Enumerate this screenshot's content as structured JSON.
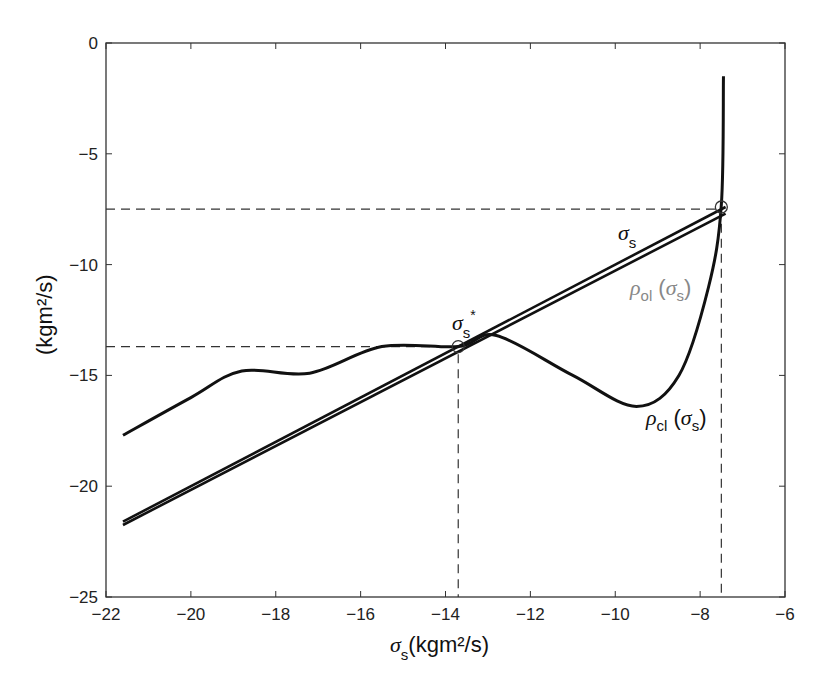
{
  "chart_data": {
    "type": "line",
    "title": "",
    "xlabel": "σs⁻ (kgm²/s)",
    "ylabel": "(kgm²/s)",
    "xlim": [
      -22,
      -6
    ],
    "ylim": [
      -25,
      0
    ],
    "xticks": [
      "-22",
      "-20",
      "-18",
      "-16",
      "-14",
      "-12",
      "-10",
      "-8",
      "-6"
    ],
    "yticks": [
      "0",
      "-5",
      "-10",
      "-15",
      "-20",
      "-25"
    ],
    "grid": false,
    "series": [
      {
        "name": "σs⁻ (identity line)",
        "x": [
          -21.6,
          -7.4
        ],
        "y": [
          -21.6,
          -7.4
        ]
      },
      {
        "name": "ρol(σs⁻)",
        "x": [
          -21.6,
          -7.4
        ],
        "y": [
          -21.75,
          -7.7
        ]
      },
      {
        "name": "ρcl(σs⁻)",
        "x": [
          -21.6,
          -20,
          -18.8,
          -17.2,
          -15.5,
          -13.7,
          -12.8,
          -11,
          -9.5,
          -8.5,
          -7.8,
          -7.5,
          -7.45
        ],
        "y": [
          -17.7,
          -16,
          -14.8,
          -14.9,
          -13.7,
          -13.7,
          -13.2,
          -15,
          -16.4,
          -15,
          -11,
          -7.3,
          -1.5
        ]
      }
    ],
    "annotations": [
      {
        "text": "σs⁻*",
        "x": -13.7,
        "y": -13.7,
        "marker": "circle"
      },
      {
        "text": "σs⁻",
        "x": -7.5,
        "y": -7.4,
        "marker": "circle"
      },
      {
        "text": "ρol(σs⁻)",
        "color": "#888888"
      },
      {
        "text": "ρcl(σs⁻)"
      }
    ],
    "dashed_guides": [
      {
        "x": -13.7,
        "y": -13.7
      },
      {
        "x": -7.5,
        "y": -7.5
      }
    ]
  },
  "labels": {
    "sigma": "σ",
    "s": "s",
    "minus": "−",
    "star": "*",
    "rho": "ρ",
    "ol": "ol",
    "cl": "cl",
    "unit": "(kgm²/s)"
  }
}
